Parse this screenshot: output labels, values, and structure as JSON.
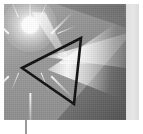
{
  "figure": {
    "width_px": 143,
    "height_px": 134,
    "color_mode": "grayscale"
  },
  "panel": {
    "name": "photo-panel",
    "left_px": 4,
    "top_px": 4,
    "width_px": 122,
    "height_px": 116,
    "background_color": "#9b9b9b"
  },
  "elements": {
    "starburst": {
      "label": "starburst light source",
      "center_x_px": 30,
      "center_y_px": 25,
      "color": "#ffffff",
      "ray_count": 16
    },
    "prism": {
      "label": "triangular prism outline",
      "orientation": "left-pointing",
      "stroke_color": "#0d0d0d",
      "stroke_width_px": 2.6,
      "vertices": [
        {
          "name": "apex-left",
          "x": 18,
          "y": 64
        },
        {
          "name": "top-right",
          "x": 77,
          "y": 34
        },
        {
          "name": "bottom-right",
          "x": 70,
          "y": 100
        }
      ]
    },
    "light_cone": {
      "label": "refracted light cone",
      "direction": "right",
      "highlight_color": "#ffffff",
      "shadow_color": "#3c3c3c"
    },
    "incident_beam": {
      "label": "incident beam",
      "from": "starburst",
      "to": "prism"
    },
    "right_band": {
      "label": "light vertical band",
      "left_px": 126,
      "top_px": 4,
      "width_px": 13,
      "height_px": 116,
      "color": "#e1e1e1"
    },
    "stem": {
      "label": "vertical stem line",
      "left_px": 25,
      "top_px": 120,
      "width_px": 1.5,
      "height_px": 14,
      "color": "#9a9a9a"
    }
  }
}
